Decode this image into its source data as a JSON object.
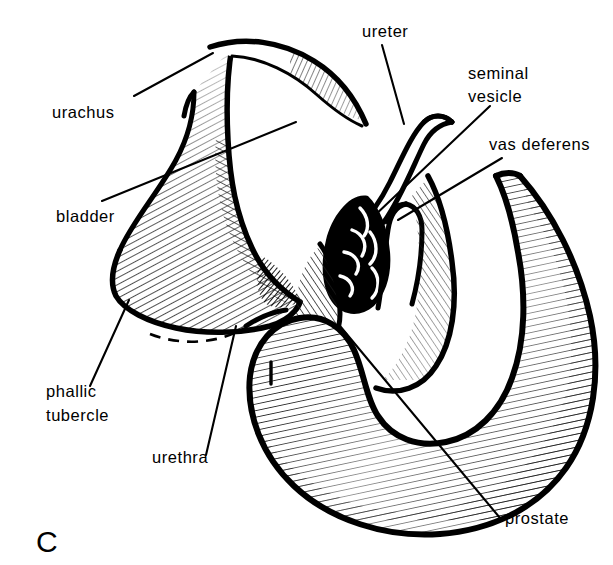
{
  "figure": {
    "panel_letter": "C",
    "background_color": "#ffffff",
    "ink_color": "#000000",
    "width": 613,
    "height": 565,
    "style": "pen-and-ink line drawing with parallel hatching"
  },
  "labels": [
    {
      "id": "urachus",
      "text": "urachus",
      "x": 52,
      "y": 118
    },
    {
      "id": "bladder",
      "text": "bladder",
      "x": 56,
      "y": 222
    },
    {
      "id": "ureter",
      "text": "ureter",
      "x": 362,
      "y": 37
    },
    {
      "id": "seminal",
      "text": "seminal",
      "x": 468,
      "y": 79
    },
    {
      "id": "vesicle",
      "text": "vesicle",
      "x": 468,
      "y": 102
    },
    {
      "id": "vas-deferens",
      "text": "vas deferens",
      "x": 489,
      "y": 150
    },
    {
      "id": "phallic",
      "text": "phallic",
      "x": 46,
      "y": 397
    },
    {
      "id": "tubercle",
      "text": "tubercle",
      "x": 46,
      "y": 421
    },
    {
      "id": "urethra",
      "text": "urethra",
      "x": 152,
      "y": 463
    },
    {
      "id": "prostate",
      "text": "prostate",
      "x": 505,
      "y": 524
    }
  ],
  "structures": [
    {
      "id": "bladder",
      "name": "bladder"
    },
    {
      "id": "urachus",
      "name": "urachus"
    },
    {
      "id": "ureter",
      "name": "ureter"
    },
    {
      "id": "seminal-vesicle",
      "name": "seminal vesicle"
    },
    {
      "id": "vas-deferens",
      "name": "vas deferens"
    },
    {
      "id": "prostate",
      "name": "prostate"
    },
    {
      "id": "urethra",
      "name": "urethra"
    },
    {
      "id": "phallic-tubercle",
      "name": "phallic tubercle"
    }
  ]
}
